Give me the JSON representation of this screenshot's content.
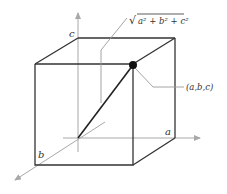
{
  "diagram": {
    "labels": {
      "axis_a": "a",
      "axis_b": "b",
      "axis_c": "c",
      "point": "(a,b,c)",
      "diagonal_formula_radicand": "a² + b² + c²",
      "diagonal_formula_root": "√"
    },
    "colors": {
      "axis": "#a8a8a8",
      "edge": "#333333",
      "diagonal": "#222222",
      "point": "#111111",
      "leader": "#9a9a9a"
    },
    "geometry": {
      "origin": [
        78,
        138
      ],
      "point": [
        133,
        65
      ],
      "cube_front": {
        "top_left": [
          35,
          64
        ],
        "top_right": [
          133,
          64
        ],
        "bottom_left": [
          35,
          165
        ],
        "bottom_right": [
          133,
          165
        ]
      },
      "cube_back": {
        "top_left": [
          78,
          38
        ],
        "top_right": [
          175,
          38
        ],
        "bottom_right": [
          175,
          138
        ]
      },
      "axis_a_tip": [
        202,
        138
      ],
      "axis_b_tip": [
        13,
        182
      ],
      "axis_c_tip": [
        78,
        11
      ]
    }
  }
}
